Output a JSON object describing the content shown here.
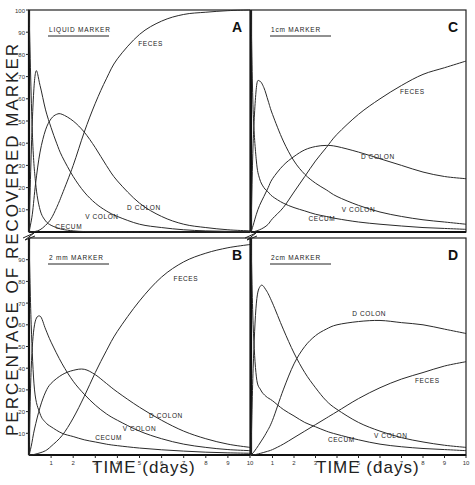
{
  "figure": {
    "y_axis_label": "PERCENTAGE OF RECOVERED MARKER",
    "x_axis_label": "TIME (days)"
  },
  "chart_data": [
    {
      "type": "line",
      "panel": "A",
      "title": "LIQUID MARKER",
      "xlabel": "TIME (days)",
      "ylabel": "PERCENTAGE OF RECOVERED MARKER",
      "xlim": [
        0,
        10
      ],
      "ylim": [
        0,
        100
      ],
      "x_ticks": [
        1,
        2,
        3,
        4,
        5,
        6,
        7,
        8,
        9,
        10
      ],
      "y_ticks": [
        10,
        20,
        30,
        40,
        50,
        60,
        70,
        80,
        90,
        100
      ],
      "grid": false,
      "x": [
        0,
        0.15,
        0.3,
        0.5,
        0.75,
        1,
        1.25,
        1.5,
        2,
        2.5,
        3,
        3.5,
        4,
        5,
        6,
        7,
        8,
        9,
        10
      ],
      "series": [
        {
          "name": "CECUM",
          "values": [
            100,
            45,
            22,
            10,
            5,
            3,
            2,
            1.2,
            0.5,
            0.2,
            0.1,
            0,
            0,
            0,
            0,
            0,
            0,
            0,
            0
          ]
        },
        {
          "name": "V COLON",
          "values": [
            0,
            50,
            72,
            66,
            55,
            47,
            40,
            34,
            25,
            18,
            13,
            9.5,
            7,
            3.5,
            2,
            1,
            0.5,
            0.3,
            0.2
          ]
        },
        {
          "name": "D COLON",
          "values": [
            0,
            8,
            22,
            36,
            46,
            51,
            53,
            53,
            50,
            45,
            38,
            30,
            23,
            13,
            7,
            3.5,
            2,
            1,
            0.5
          ]
        },
        {
          "name": "FECES",
          "values": [
            0,
            0,
            0.3,
            1,
            3,
            6,
            11,
            17,
            30,
            45,
            58,
            69,
            78,
            89,
            95,
            98,
            99,
            99.7,
            100
          ]
        }
      ],
      "labels": [
        {
          "text": "FECES",
          "x": 5.5,
          "y": 84
        },
        {
          "text": "D COLON",
          "x": 5.2,
          "y": 10
        },
        {
          "text": "V COLON",
          "x": 3.3,
          "y": 6
        },
        {
          "text": "CECUM",
          "x": 1.8,
          "y": 1.5
        }
      ]
    },
    {
      "type": "line",
      "panel": "B",
      "title": "2 mm MARKER",
      "xlabel": "TIME (days)",
      "ylabel": "PERCENTAGE OF RECOVERED MARKER",
      "xlim": [
        0,
        10
      ],
      "ylim": [
        0,
        100
      ],
      "x_ticks": [
        1,
        2,
        3,
        4,
        5,
        6,
        7,
        8,
        9,
        10
      ],
      "y_ticks": [
        10,
        20,
        30,
        40,
        50,
        60,
        70,
        80,
        90
      ],
      "grid": false,
      "x": [
        0,
        0.1,
        0.25,
        0.5,
        0.75,
        1,
        1.5,
        2,
        2.5,
        3,
        3.5,
        4,
        5,
        6,
        7,
        8,
        9,
        10
      ],
      "series": [
        {
          "name": "CECUM",
          "values": [
            100,
            60,
            30,
            19,
            15,
            13,
            10,
            8.5,
            7,
            6,
            5,
            4.3,
            3.2,
            2.4,
            1.8,
            1.3,
            1,
            0.8
          ]
        },
        {
          "name": "V COLON",
          "values": [
            0,
            40,
            60,
            64,
            58,
            52,
            42,
            34,
            28,
            23,
            19,
            16,
            11,
            7.5,
            5,
            3.5,
            2.5,
            2
          ]
        },
        {
          "name": "D COLON",
          "values": [
            0,
            4,
            12,
            22,
            29,
            33,
            37,
            39,
            39.5,
            37,
            33,
            29,
            22,
            16,
            11,
            7.5,
            5,
            3.5
          ]
        },
        {
          "name": "FECES",
          "values": [
            0,
            0,
            0.3,
            1,
            2,
            4,
            9,
            17,
            27,
            38,
            48,
            57,
            71,
            82,
            89,
            93,
            95.5,
            97
          ]
        }
      ],
      "labels": [
        {
          "text": "FECES",
          "x": 7.1,
          "y": 80
        },
        {
          "text": "D COLON",
          "x": 6.2,
          "y": 17
        },
        {
          "text": "V COLON",
          "x": 5.0,
          "y": 11
        },
        {
          "text": "CECUM",
          "x": 3.6,
          "y": 7
        }
      ]
    },
    {
      "type": "line",
      "panel": "C",
      "title": "1cm MARKER",
      "xlabel": "TIME (days)",
      "ylabel": "PERCENTAGE OF RECOVERED MARKER",
      "xlim": [
        0,
        10
      ],
      "ylim": [
        0,
        100
      ],
      "x_ticks": [
        1,
        2,
        3,
        4,
        5,
        6,
        7,
        8,
        9,
        10
      ],
      "grid": false,
      "x": [
        0,
        0.1,
        0.25,
        0.4,
        0.6,
        0.8,
        1,
        1.5,
        2,
        2.5,
        3,
        3.5,
        4,
        5,
        6,
        7,
        8,
        9,
        10
      ],
      "series": [
        {
          "name": "CECUM",
          "values": [
            100,
            55,
            32,
            24,
            20,
            18,
            16,
            13,
            11,
            9.5,
            8,
            7,
            6,
            4.5,
            3.5,
            2.7,
            2,
            1.6,
            1.2
          ]
        },
        {
          "name": "V COLON",
          "values": [
            0,
            40,
            65,
            68,
            65,
            59,
            53,
            41,
            32,
            26,
            22,
            19,
            16,
            12,
            9,
            7,
            5.5,
            4.5,
            3.5
          ]
        },
        {
          "name": "D COLON",
          "values": [
            0,
            3,
            8,
            12,
            16,
            20,
            24,
            30,
            34,
            37,
            38.5,
            39,
            38.5,
            36,
            33,
            30,
            27,
            25,
            24
          ]
        },
        {
          "name": "FECES",
          "values": [
            0,
            0,
            0.5,
            1,
            2,
            3.5,
            6,
            11,
            18,
            25,
            32,
            38,
            44,
            53,
            60,
            66,
            71,
            74,
            77
          ]
        }
      ],
      "labels": [
        {
          "text": "FECES",
          "x": 7.5,
          "y": 62
        },
        {
          "text": "D COLON",
          "x": 5.9,
          "y": 33
        },
        {
          "text": "V COLON",
          "x": 5.0,
          "y": 9
        },
        {
          "text": "CECUM",
          "x": 3.3,
          "y": 5
        }
      ]
    },
    {
      "type": "line",
      "panel": "D",
      "title": "2cm MARKER",
      "xlabel": "TIME (days)",
      "ylabel": "PERCENTAGE OF RECOVERED MARKER",
      "xlim": [
        0,
        10
      ],
      "ylim": [
        0,
        100
      ],
      "x_ticks": [
        1,
        2,
        3,
        4,
        5,
        6,
        7,
        8,
        9,
        10
      ],
      "grid": false,
      "x": [
        0,
        0.1,
        0.25,
        0.45,
        0.7,
        1,
        1.5,
        2,
        2.5,
        3,
        3.5,
        4,
        5,
        6,
        7,
        8,
        9,
        10
      ],
      "series": [
        {
          "name": "CECUM",
          "values": [
            100,
            60,
            36,
            30,
            27,
            25,
            21,
            18,
            15,
            13,
            11,
            9.5,
            7,
            5,
            3.8,
            3,
            2.5,
            2
          ]
        },
        {
          "name": "V COLON",
          "values": [
            0,
            40,
            70,
            78,
            76,
            70,
            58,
            47,
            38,
            31,
            25,
            21,
            15,
            11,
            8,
            6,
            4.5,
            3.5
          ]
        },
        {
          "name": "D COLON",
          "values": [
            0,
            1,
            3,
            6,
            10,
            16,
            30,
            42,
            50,
            55,
            58,
            60,
            61.5,
            62,
            61,
            60,
            58,
            56
          ]
        },
        {
          "name": "FECES",
          "values": [
            0,
            0,
            0.3,
            0.8,
            1.5,
            2.5,
            5,
            8,
            11,
            14,
            17,
            20,
            26,
            31,
            35,
            38,
            41,
            43
          ]
        }
      ],
      "labels": [
        {
          "text": "D COLON",
          "x": 5.5,
          "y": 64
        },
        {
          "text": "FECES",
          "x": 8.2,
          "y": 33
        },
        {
          "text": "V COLON",
          "x": 6.5,
          "y": 8
        },
        {
          "text": "CECUM",
          "x": 4.2,
          "y": 6
        }
      ]
    }
  ]
}
